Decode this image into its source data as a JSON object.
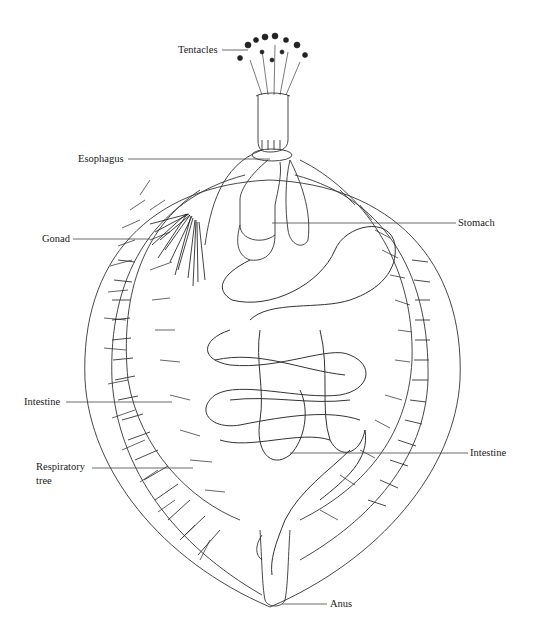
{
  "figure": {
    "colors": {
      "ink": "#1a1a1a",
      "line": "#333333",
      "background": "#ffffff"
    }
  },
  "labels": {
    "tentacles": "Tentacles",
    "esophagus": "Esophagus",
    "stomach": "Stomach",
    "gonad": "Gonad",
    "intestine_left": "Intestine",
    "intestine_right": "Intestine",
    "respiratory_tree_line1": "Respiratory",
    "respiratory_tree_line2": "tree",
    "anus": "Anus"
  }
}
